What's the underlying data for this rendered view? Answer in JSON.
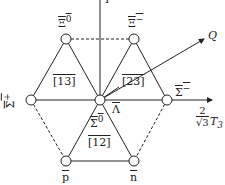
{
  "diagram": {
    "type": "weight-diagram",
    "axes": {
      "vertical": {
        "label": "Y"
      },
      "horizontal": {
        "label_num": "2",
        "label_den": "√3",
        "label_var": "T",
        "label_sub": "3"
      },
      "oblique": {
        "label": "Q"
      }
    },
    "nodes": [
      {
        "id": "xi0",
        "label": "Ξ",
        "sup": "0"
      },
      {
        "id": "ximinus",
        "label": "Ξ",
        "sup": "−"
      },
      {
        "id": "sigmaplus",
        "label": "Σ",
        "sup": "+"
      },
      {
        "id": "sigmaminus",
        "label": "Σ",
        "sup": "−"
      },
      {
        "id": "center_lambda",
        "label": "Λ"
      },
      {
        "id": "center_sigma0",
        "label": "Σ",
        "sup": "0"
      },
      {
        "id": "p",
        "label": "p"
      },
      {
        "id": "n",
        "label": "n"
      }
    ],
    "triangles": [
      {
        "id": "t13",
        "label": "[13]"
      },
      {
        "id": "t23",
        "label": "[23]"
      },
      {
        "id": "t12",
        "label": "[12]"
      }
    ],
    "colors": {
      "line": "#222222",
      "node_fill": "#ffffff"
    }
  }
}
